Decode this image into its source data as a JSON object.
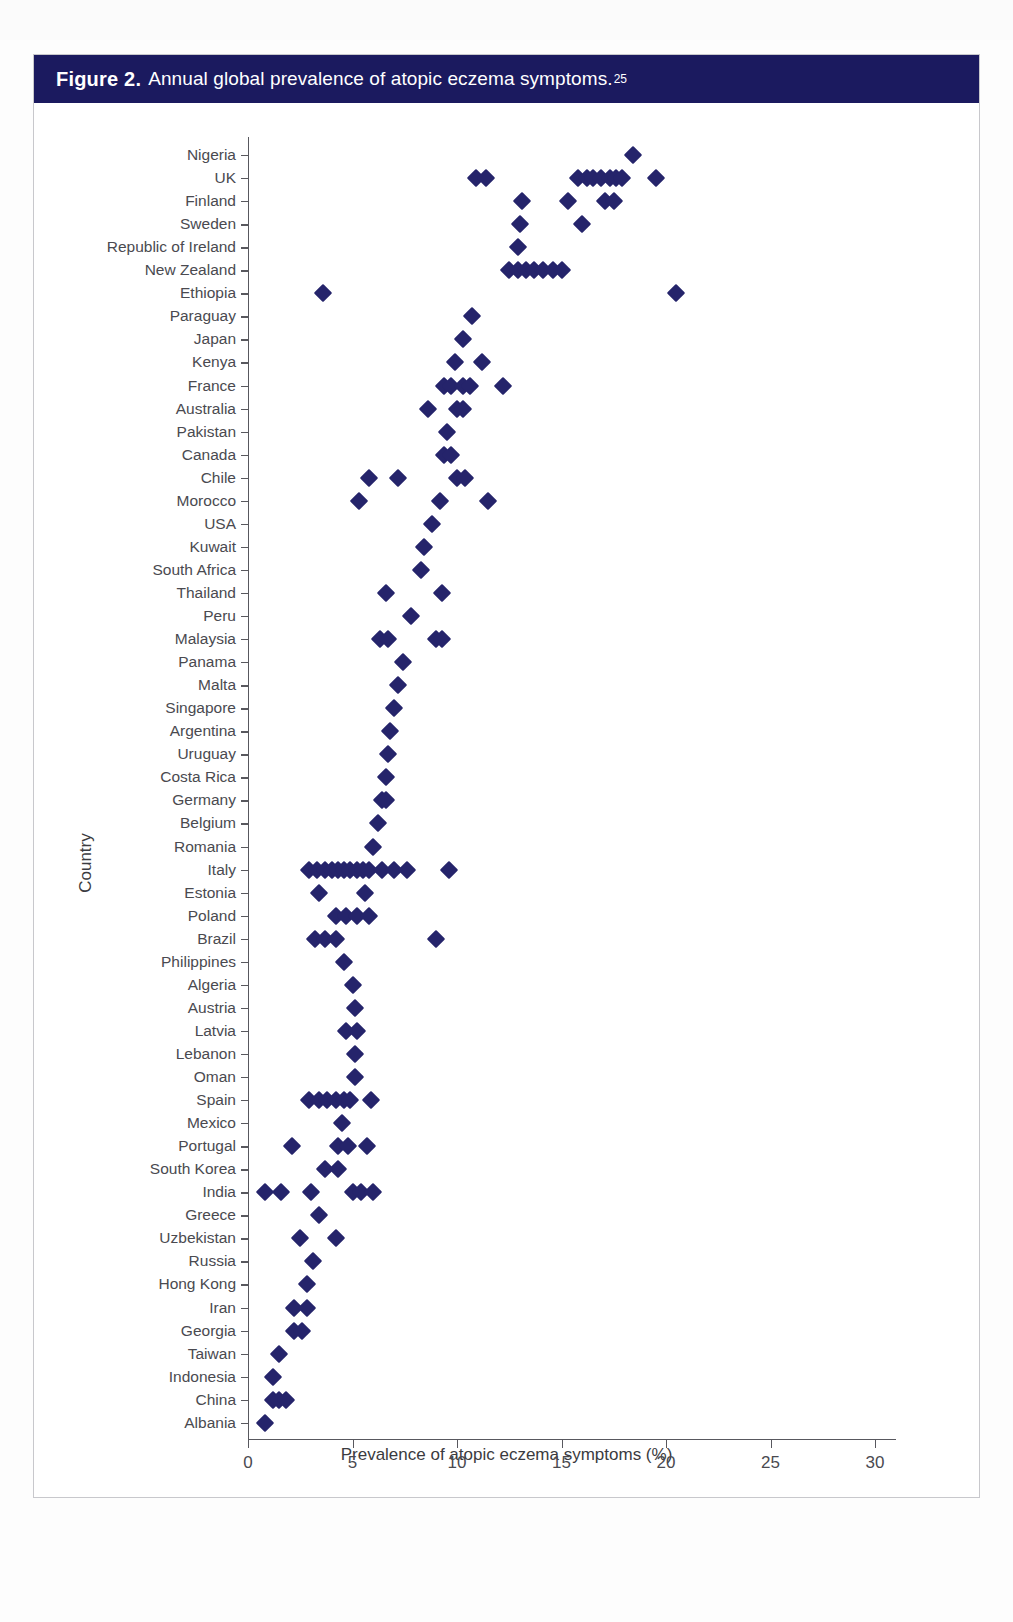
{
  "figure": {
    "number_label": "Figure 2.",
    "caption": "Annual global prevalence of atopic eczema symptoms.",
    "reference_superscript": "25",
    "header_color": "#1b1a5f",
    "marker_color": "#25246b"
  },
  "chart_data": {
    "type": "scatter",
    "title": "Annual global prevalence of atopic eczema symptoms.",
    "xlabel": "Prevalence of atopic eczema symptoms (%)",
    "ylabel": "Country",
    "xlim": [
      0,
      31
    ],
    "xticks": [
      0,
      5,
      10,
      15,
      20,
      25,
      30
    ],
    "xtick_labels": [
      "0",
      "5",
      "10",
      "15",
      "20",
      "25",
      "30"
    ],
    "grid": false,
    "legend": null,
    "categories": [
      "Nigeria",
      "UK",
      "Finland",
      "Sweden",
      "Republic of Ireland",
      "New Zealand",
      "Ethiopia",
      "Paraguay",
      "Japan",
      "Kenya",
      "France",
      "Australia",
      "Pakistan",
      "Canada",
      "Chile",
      "Morocco",
      "USA",
      "Kuwait",
      "South Africa",
      "Thailand",
      "Peru",
      "Malaysia",
      "Panama",
      "Malta",
      "Singapore",
      "Argentina",
      "Uruguay",
      "Costa Rica",
      "Germany",
      "Belgium",
      "Romania",
      "Italy",
      "Estonia",
      "Poland",
      "Brazil",
      "Philippines",
      "Algeria",
      "Austria",
      "Latvia",
      "Lebanon",
      "Oman",
      "Spain",
      "Mexico",
      "Portugal",
      "South Korea",
      "India",
      "Greece",
      "Uzbekistan",
      "Russia",
      "Hong Kong",
      "Iran",
      "Georgia",
      "Taiwan",
      "Indonesia",
      "China",
      "Albania"
    ],
    "points_by_category": [
      {
        "country": "Nigeria",
        "values": [
          18.4
        ]
      },
      {
        "country": "UK",
        "values": [
          10.9,
          11.4,
          15.8,
          16.2,
          16.5,
          16.9,
          17.3,
          17.6,
          17.9,
          19.5
        ]
      },
      {
        "country": "Finland",
        "values": [
          13.1,
          15.3,
          17.1,
          17.5
        ]
      },
      {
        "country": "Sweden",
        "values": [
          13.0,
          16.0
        ]
      },
      {
        "country": "Republic of Ireland",
        "values": [
          12.9
        ]
      },
      {
        "country": "New Zealand",
        "values": [
          12.5,
          12.9,
          13.3,
          13.7,
          14.1,
          14.6,
          15.0
        ]
      },
      {
        "country": "Ethiopia",
        "values": [
          3.6,
          20.5
        ]
      },
      {
        "country": "Paraguay",
        "values": [
          10.7
        ]
      },
      {
        "country": "Japan",
        "values": [
          10.3
        ]
      },
      {
        "country": "Kenya",
        "values": [
          9.9,
          11.2
        ]
      },
      {
        "country": "France",
        "values": [
          9.4,
          9.7,
          10.3,
          10.6,
          12.2
        ]
      },
      {
        "country": "Australia",
        "values": [
          8.6,
          10.0,
          10.3
        ]
      },
      {
        "country": "Pakistan",
        "values": [
          9.5
        ]
      },
      {
        "country": "Canada",
        "values": [
          9.4,
          9.7
        ]
      },
      {
        "country": "Chile",
        "values": [
          5.8,
          7.2,
          10.0,
          10.4
        ]
      },
      {
        "country": "Morocco",
        "values": [
          5.3,
          9.2,
          11.5
        ]
      },
      {
        "country": "USA",
        "values": [
          8.8
        ]
      },
      {
        "country": "Kuwait",
        "values": [
          8.4
        ]
      },
      {
        "country": "South Africa",
        "values": [
          8.3
        ]
      },
      {
        "country": "Thailand",
        "values": [
          6.6,
          9.3
        ]
      },
      {
        "country": "Peru",
        "values": [
          7.8
        ]
      },
      {
        "country": "Malaysia",
        "values": [
          6.3,
          6.7,
          9.0,
          9.3
        ]
      },
      {
        "country": "Panama",
        "values": [
          7.4
        ]
      },
      {
        "country": "Malta",
        "values": [
          7.2
        ]
      },
      {
        "country": "Singapore",
        "values": [
          7.0
        ]
      },
      {
        "country": "Argentina",
        "values": [
          6.8
        ]
      },
      {
        "country": "Uruguay",
        "values": [
          6.7
        ]
      },
      {
        "country": "Costa Rica",
        "values": [
          6.6
        ]
      },
      {
        "country": "Germany",
        "values": [
          6.4,
          6.6
        ]
      },
      {
        "country": "Belgium",
        "values": [
          6.2
        ]
      },
      {
        "country": "Romania",
        "values": [
          6.0
        ]
      },
      {
        "country": "Italy",
        "values": [
          2.9,
          3.3,
          3.7,
          4.0,
          4.3,
          4.6,
          4.9,
          5.2,
          5.5,
          5.8,
          6.4,
          7.0,
          7.6,
          9.6
        ]
      },
      {
        "country": "Estonia",
        "values": [
          3.4,
          5.6
        ]
      },
      {
        "country": "Poland",
        "values": [
          4.2,
          4.7,
          5.2,
          5.8
        ]
      },
      {
        "country": "Brazil",
        "values": [
          3.2,
          3.7,
          4.2,
          9.0
        ]
      },
      {
        "country": "Philippines",
        "values": [
          4.6
        ]
      },
      {
        "country": "Algeria",
        "values": [
          5.0
        ]
      },
      {
        "country": "Austria",
        "values": [
          5.1
        ]
      },
      {
        "country": "Latvia",
        "values": [
          4.7,
          5.2
        ]
      },
      {
        "country": "Lebanon",
        "values": [
          5.1
        ]
      },
      {
        "country": "Oman",
        "values": [
          5.1
        ]
      },
      {
        "country": "Spain",
        "values": [
          2.9,
          3.4,
          3.8,
          4.2,
          4.6,
          4.9,
          5.9
        ]
      },
      {
        "country": "Mexico",
        "values": [
          4.5
        ]
      },
      {
        "country": "Portugal",
        "values": [
          2.1,
          4.3,
          4.8,
          5.7
        ]
      },
      {
        "country": "South Korea",
        "values": [
          3.7,
          4.3
        ]
      },
      {
        "country": "India",
        "values": [
          0.8,
          1.6,
          3.0,
          5.0,
          5.4,
          6.0
        ]
      },
      {
        "country": "Greece",
        "values": [
          3.4
        ]
      },
      {
        "country": "Uzbekistan",
        "values": [
          2.5,
          4.2
        ]
      },
      {
        "country": "Russia",
        "values": [
          3.1
        ]
      },
      {
        "country": "Hong Kong",
        "values": [
          2.8
        ]
      },
      {
        "country": "Iran",
        "values": [
          2.2,
          2.8
        ]
      },
      {
        "country": "Georgia",
        "values": [
          2.2,
          2.6
        ]
      },
      {
        "country": "Taiwan",
        "values": [
          1.5
        ]
      },
      {
        "country": "Indonesia",
        "values": [
          1.2
        ]
      },
      {
        "country": "China",
        "values": [
          1.2,
          1.5,
          1.8
        ]
      },
      {
        "country": "Albania",
        "values": [
          0.8
        ]
      }
    ]
  }
}
